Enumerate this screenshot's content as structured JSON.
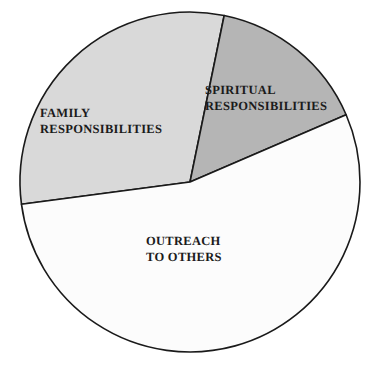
{
  "chart_data": {
    "type": "pie",
    "title": "",
    "subtitle": "",
    "xlabel": "",
    "ylabel": "",
    "legend_position": "none",
    "grid": false,
    "labels_on_slices": true,
    "center": {
      "x": 190,
      "y": 182
    },
    "radius": 170,
    "start_angle_deg": -78.4,
    "categories": [
      "FAMILY RESPONSIBILITIES",
      "SPIRITUAL RESPONSIBILITIES",
      "OUTREACH TO OTHERS"
    ],
    "values": [
      29.2,
      15.3,
      55.5
    ],
    "units": "percent",
    "slices": [
      {
        "name": "FAMILY RESPONSIBILITIES",
        "label_line1": "FAMILY",
        "label_line2": "RESPONSIBILITIES",
        "label_text": "FAMILY\nRESPONSIBILITIES",
        "value": 29.2,
        "start_angle_deg": -78.4,
        "end_angle_deg": -187.5,
        "sweep_deg": 105.9,
        "fill": "#d9d9d9",
        "stroke": "#1a1a1a"
      },
      {
        "name": "SPIRITUAL RESPONSIBILITIES",
        "label_line1": "SPIRITUAL",
        "label_line2": "RESPONSIBILITIES",
        "label_text": "SPIRITUAL\nRESPONSIBILITIES",
        "value": 15.3,
        "start_angle_deg": -78.4,
        "end_angle_deg": -23.3,
        "sweep_deg": 55.1,
        "fill": "#b5b5b5",
        "stroke": "#1a1a1a"
      },
      {
        "name": "OUTREACH TO OTHERS",
        "label_line1": "OUTREACH",
        "label_line2": "TO OTHERS",
        "label_text": "OUTREACH\nTO OTHERS",
        "value": 55.5,
        "start_angle_deg": -23.3,
        "end_angle_deg": 172.5,
        "sweep_deg": 195.8,
        "fill": "#fcfcfc",
        "stroke": "#1a1a1a"
      }
    ],
    "colors": {
      "family": "#d9d9d9",
      "spiritual": "#b5b5b5",
      "outreach": "#fcfcfc",
      "outline": "#1a1a1a",
      "label_text": "#1b1b1b",
      "background": "#ffffff"
    }
  }
}
